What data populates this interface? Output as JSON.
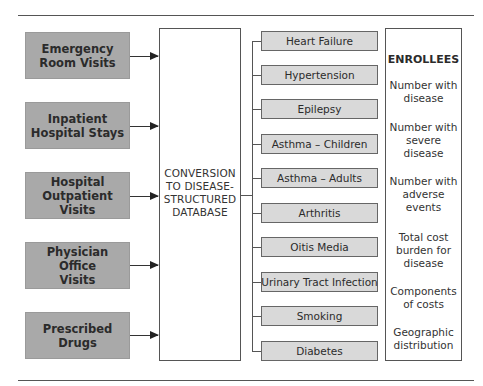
{
  "sources": [
    {
      "label": "Emergency Room Visits",
      "lines": [
        "Emergency",
        "Room Visits"
      ]
    },
    {
      "label": "Inpatient Hospital Stays",
      "lines": [
        "Inpatient",
        "Hospital Stays"
      ]
    },
    {
      "label": "Hospital Outpatient Visits",
      "lines": [
        "Hospital",
        "Outpatient Visits"
      ]
    },
    {
      "label": "Physician Office Visits",
      "lines": [
        "Physician Office",
        "Visits"
      ]
    },
    {
      "label": "Prescribed Drugs",
      "lines": [
        "Prescribed",
        "Drugs"
      ]
    }
  ],
  "central": {
    "lines": [
      "CONVERSION",
      "TO DISEASE-",
      "STRUCTURED",
      "DATABASE"
    ]
  },
  "diseases": [
    "Heart Failure",
    "Hypertension",
    "Epilepsy",
    "Asthma – Children",
    "Asthma – Adults",
    "Arthritis",
    "Oitis Media",
    "Urinary Tract Infection",
    "Smoking",
    "Diabetes"
  ],
  "enrollees": {
    "title": "ENROLLEES",
    "items": [
      {
        "lines": [
          "Number with",
          "disease"
        ]
      },
      {
        "lines": [
          "Number with",
          "severe",
          "disease"
        ]
      },
      {
        "lines": [
          "Number with",
          "adverse",
          "events"
        ]
      },
      {
        "lines": [
          "Total cost",
          "burden for",
          "disease"
        ]
      },
      {
        "lines": [
          "Components",
          "of costs"
        ]
      },
      {
        "lines": [
          "Geographic",
          "distribution"
        ]
      }
    ]
  },
  "colors": {
    "source_fill": "#a9a9a9",
    "disease_fill": "#d9d9d9",
    "line": "#555555"
  }
}
